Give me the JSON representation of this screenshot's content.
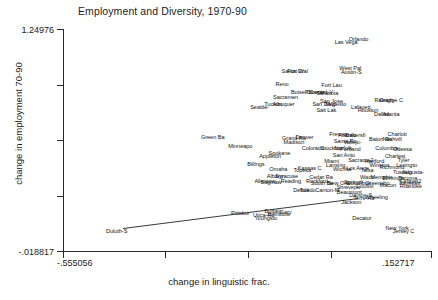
{
  "chart_data": {
    "type": "scatter",
    "title": "Employment and Diversity, 1970-90",
    "xlabel": "change in linguistic frac.",
    "ylabel": "change in employment 70-90",
    "xlim": [
      -0.555056,
      0.152717
    ],
    "ylim": [
      -0.018817,
      1.24976
    ],
    "xticks": [
      "-.555056",
      "",
      "",
      ".152717"
    ],
    "yticks": [
      "1.24976",
      "",
      "",
      "",
      "-.018817"
    ],
    "xtick_labels": {
      "min": "-.555056",
      "max": ".152717"
    },
    "ytick_labels": {
      "min": "-.018817",
      "max": "1.24976"
    },
    "grid": false,
    "legend": false,
    "marker": "text-label",
    "fit_line": {
      "type": "linear",
      "x0": -0.44,
      "y0": 0.115,
      "x1": 0.01,
      "y1": 0.285
    },
    "points": [
      {
        "label": "Orlando",
        "x": 0.012,
        "y": 1.188
      },
      {
        "label": "Las Vega",
        "x": -0.012,
        "y": 1.172
      },
      {
        "label": "West Pal",
        "x": -0.004,
        "y": 1.022
      },
      {
        "label": "Austin-S",
        "x": -0.002,
        "y": 1.002
      },
      {
        "label": "Santa Cr",
        "x": -0.115,
        "y": 1.008
      },
      {
        "label": "Fort Wal",
        "x": -0.105,
        "y": 1.006
      },
      {
        "label": "Reno",
        "x": -0.135,
        "y": 0.93
      },
      {
        "label": "Fort Lau",
        "x": -0.04,
        "y": 0.925
      },
      {
        "label": "Boise Ci",
        "x": -0.098,
        "y": 0.888
      },
      {
        "label": "Phoenix",
        "x": -0.072,
        "y": 0.888
      },
      {
        "label": "Oxnard-V",
        "x": -0.06,
        "y": 0.884
      },
      {
        "label": "Sarasota",
        "x": -0.048,
        "y": 0.882
      },
      {
        "label": "Sacramen",
        "x": -0.128,
        "y": 0.855
      },
      {
        "label": "San Jose",
        "x": -0.04,
        "y": 0.835
      },
      {
        "label": "Tucson",
        "x": -0.152,
        "y": 0.82
      },
      {
        "label": "Albuquer",
        "x": -0.132,
        "y": 0.818
      },
      {
        "label": "San Dieg",
        "x": -0.055,
        "y": 0.818
      },
      {
        "label": "Modesto",
        "x": -0.032,
        "y": 0.816
      },
      {
        "label": "Seattle-",
        "x": -0.178,
        "y": 0.8
      },
      {
        "label": "Salt Lak",
        "x": -0.05,
        "y": 0.782
      },
      {
        "label": "Raleigh-",
        "x": 0.062,
        "y": 0.84
      },
      {
        "label": "Orange C",
        "x": 0.074,
        "y": 0.838
      },
      {
        "label": "Lafayett",
        "x": 0.016,
        "y": 0.8
      },
      {
        "label": "Houston",
        "x": 0.03,
        "y": 0.782
      },
      {
        "label": "Dallas",
        "x": 0.056,
        "y": 0.76
      },
      {
        "label": "Atlanta",
        "x": 0.074,
        "y": 0.758
      },
      {
        "label": "Green Ba",
        "x": -0.268,
        "y": 0.63
      },
      {
        "label": "Grand Ra",
        "x": -0.112,
        "y": 0.625
      },
      {
        "label": "Denver",
        "x": -0.092,
        "y": 0.632
      },
      {
        "label": "Fresno",
        "x": -0.028,
        "y": 0.645
      },
      {
        "label": "Atlantic",
        "x": -0.01,
        "y": 0.64
      },
      {
        "label": "Bakersfi",
        "x": 0.006,
        "y": 0.642
      },
      {
        "label": "Charlott",
        "x": 0.086,
        "y": 0.648
      },
      {
        "label": "Madison",
        "x": -0.112,
        "y": 0.6
      },
      {
        "label": "Baton Ro",
        "x": 0.054,
        "y": 0.62
      },
      {
        "label": "Nashvill",
        "x": 0.076,
        "y": 0.618
      },
      {
        "label": "Minneapo",
        "x": -0.215,
        "y": 0.578
      },
      {
        "label": "Santa Ro",
        "x": -0.014,
        "y": 0.605
      },
      {
        "label": "Vallejo-",
        "x": 0.0,
        "y": 0.602
      },
      {
        "label": "Columbia",
        "x": 0.066,
        "y": 0.57
      },
      {
        "label": "Colorado",
        "x": -0.076,
        "y": 0.568
      },
      {
        "label": "Stockton",
        "x": -0.04,
        "y": 0.566
      },
      {
        "label": "Norfolk",
        "x": -0.018,
        "y": 0.566
      },
      {
        "label": "Portland",
        "x": -0.004,
        "y": 0.564
      },
      {
        "label": "Odessa",
        "x": 0.096,
        "y": 0.56
      },
      {
        "label": "Spokane",
        "x": -0.14,
        "y": 0.538
      },
      {
        "label": "Appleton",
        "x": -0.158,
        "y": 0.524
      },
      {
        "label": "San Anto",
        "x": -0.016,
        "y": 0.53
      },
      {
        "label": "Charlest",
        "x": 0.082,
        "y": 0.52
      },
      {
        "label": "Tyler",
        "x": 0.098,
        "y": 0.5
      },
      {
        "label": "Miami",
        "x": -0.04,
        "y": 0.492
      },
      {
        "label": "Sacrame2",
        "x": 0.016,
        "y": 0.5
      },
      {
        "label": "Hartford",
        "x": 0.042,
        "y": 0.496
      },
      {
        "label": "Winston",
        "x": 0.052,
        "y": 0.468
      },
      {
        "label": "Richmond",
        "x": 0.076,
        "y": 0.462
      },
      {
        "label": "Lexingto",
        "x": 0.104,
        "y": 0.468
      },
      {
        "label": "Billings",
        "x": -0.185,
        "y": 0.478
      },
      {
        "label": "Omaha",
        "x": -0.142,
        "y": 0.448
      },
      {
        "label": "Kansas C",
        "x": -0.082,
        "y": 0.452
      },
      {
        "label": "Topeka",
        "x": -0.096,
        "y": 0.442
      },
      {
        "label": "Lansing",
        "x": -0.032,
        "y": 0.468
      },
      {
        "label": "Wichita",
        "x": -0.02,
        "y": 0.448
      },
      {
        "label": "Los Ange",
        "x": 0.01,
        "y": 0.452
      },
      {
        "label": "Tulsa",
        "x": 0.028,
        "y": 0.44
      },
      {
        "label": "Tuscalo",
        "x": 0.096,
        "y": 0.432
      },
      {
        "label": "Augusta-",
        "x": 0.116,
        "y": 0.43
      },
      {
        "label": "Albany",
        "x": -0.148,
        "y": 0.406
      },
      {
        "label": "Syracuse",
        "x": -0.126,
        "y": 0.408
      },
      {
        "label": "Cedar Ra",
        "x": -0.06,
        "y": 0.404
      },
      {
        "label": "Waco",
        "x": 0.028,
        "y": 0.404
      },
      {
        "label": "Memphis",
        "x": 0.056,
        "y": 0.4
      },
      {
        "label": "Birmingh",
        "x": 0.078,
        "y": 0.396
      },
      {
        "label": "Tacoma",
        "x": 0.106,
        "y": 0.396
      },
      {
        "label": "Lafayet2",
        "x": 0.112,
        "y": 0.38
      },
      {
        "label": "Allentow",
        "x": -0.168,
        "y": 0.382
      },
      {
        "label": "Saginaw",
        "x": -0.156,
        "y": 0.376
      },
      {
        "label": "Reading",
        "x": -0.118,
        "y": 0.38
      },
      {
        "label": "Rockford",
        "x": -0.068,
        "y": 0.382
      },
      {
        "label": "South Be",
        "x": -0.058,
        "y": 0.37
      },
      {
        "label": "New Orle",
        "x": -0.026,
        "y": 0.366
      },
      {
        "label": "Springfi",
        "x": 0.002,
        "y": 0.372
      },
      {
        "label": "Columbus",
        "x": 0.012,
        "y": 0.368
      },
      {
        "label": "Greensbo",
        "x": 0.048,
        "y": 0.368
      },
      {
        "label": "Macon",
        "x": 0.068,
        "y": 0.356
      },
      {
        "label": "Fayettev",
        "x": 0.11,
        "y": 0.368
      },
      {
        "label": "Roanoke",
        "x": 0.112,
        "y": 0.352
      },
      {
        "label": "Louisvi",
        "x": 0.024,
        "y": 0.35
      },
      {
        "label": "Shrevepo",
        "x": -0.008,
        "y": 0.348
      },
      {
        "label": "Duluth-S",
        "x": -0.452,
        "y": 0.095
      },
      {
        "label": "Detroit",
        "x": -0.098,
        "y": 0.33
      },
      {
        "label": "Toledo",
        "x": -0.086,
        "y": 0.328
      },
      {
        "label": "Canton-M",
        "x": -0.048,
        "y": 0.326
      },
      {
        "label": "Beaumont",
        "x": -0.006,
        "y": 0.316
      },
      {
        "label": "Dayton-S",
        "x": 0.016,
        "y": 0.3
      },
      {
        "label": "Terre Ha",
        "x": 0.022,
        "y": 0.284
      },
      {
        "label": "Wheeling",
        "x": 0.046,
        "y": 0.286
      },
      {
        "label": "Jackson",
        "x": -0.002,
        "y": 0.262
      },
      {
        "label": "Pittsbur",
        "x": -0.215,
        "y": 0.2
      },
      {
        "label": "Buffalo",
        "x": -0.152,
        "y": 0.208
      },
      {
        "label": "Gary",
        "x": -0.128,
        "y": 0.206
      },
      {
        "label": "Utica-Ro",
        "x": -0.17,
        "y": 0.188
      },
      {
        "label": "Johnstow",
        "x": -0.142,
        "y": 0.19
      },
      {
        "label": "Youngsto",
        "x": -0.166,
        "y": 0.172
      },
      {
        "label": "Decatur",
        "x": 0.018,
        "y": 0.168
      },
      {
        "label": "New York",
        "x": 0.086,
        "y": 0.11
      },
      {
        "label": "Jersey C",
        "x": 0.098,
        "y": 0.096
      }
    ]
  }
}
